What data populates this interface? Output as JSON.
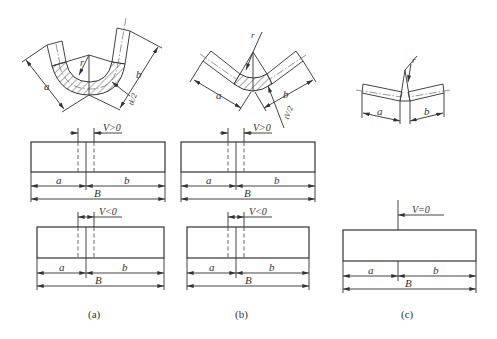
{
  "figure": {
    "panels": [
      {
        "id": "a",
        "caption": "(a)",
        "bend_labels": {
          "a": "a",
          "b": "b",
          "r": "r",
          "thickness": "tk/2"
        },
        "top_blank": {
          "v_label": "V>0",
          "a": "a",
          "b": "b",
          "B": "B"
        },
        "bottom_blank": {
          "v_label": "V<0",
          "a": "a",
          "b": "b",
          "B": "B"
        }
      },
      {
        "id": "b",
        "caption": "(b)",
        "bend_labels": {
          "a": "a",
          "b": "b",
          "r": "r",
          "thickness": "tV/2"
        },
        "top_blank": {
          "v_label": "V>0",
          "a": "a",
          "b": "b",
          "B": "B"
        },
        "bottom_blank": {
          "v_label": "V<0",
          "a": "a",
          "b": "b",
          "B": "B"
        }
      },
      {
        "id": "c",
        "caption": "(c)",
        "bend_labels": {
          "a": "a",
          "b": "b",
          "r": "r"
        },
        "blank": {
          "v_label": "V=0",
          "a": "a",
          "b": "b",
          "B": "B"
        }
      }
    ]
  }
}
